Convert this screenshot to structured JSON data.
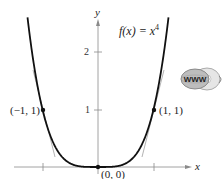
{
  "chart_data": {
    "type": "line",
    "function": "x^4",
    "xlabel": "x",
    "ylabel": "y",
    "x_ticks": [
      -1,
      1
    ],
    "x_tick_labels": [
      "",
      ""
    ],
    "y_ticks": [
      1,
      2
    ],
    "y_tick_labels": [
      "1",
      "2"
    ],
    "xlim": [
      -1.5,
      1.7
    ],
    "ylim": [
      -0.1,
      2.6
    ],
    "grid": false,
    "legend": null,
    "series": [
      {
        "name": "f(x) = x^4",
        "x": [
          -1.27,
          -1.0,
          -0.75,
          -0.5,
          -0.25,
          0,
          0.25,
          0.5,
          0.75,
          1.0,
          1.27
        ],
        "values": [
          2.6,
          1.0,
          0.316,
          0.0625,
          0.0039,
          0,
          0.0039,
          0.0625,
          0.316,
          1.0,
          2.6
        ]
      }
    ],
    "points": [
      {
        "x": -1,
        "y": 1,
        "label": "(−1, 1)"
      },
      {
        "x": 1,
        "y": 1,
        "label": "(1, 1)"
      },
      {
        "x": 0,
        "y": 0,
        "label": "(0, 0)"
      }
    ],
    "annotations": [
      "f(x) = x^4",
      "tangent lines at (−1, 1) and (1, 1)",
      "www badge"
    ]
  },
  "labels": {
    "func_name": "f(x) = x",
    "func_exp": "4",
    "x_axis": "x",
    "y_axis": "y",
    "y_tick_1": "1",
    "y_tick_2": "2",
    "pt_left": "(−1, 1)",
    "pt_right": "(1, 1)",
    "pt_origin": "(0, 0)",
    "badge_text": "WWW"
  },
  "colors": {
    "curve": "#111111",
    "axis": "#888888",
    "tangent": "#9a9a9a",
    "point": "#111111"
  }
}
